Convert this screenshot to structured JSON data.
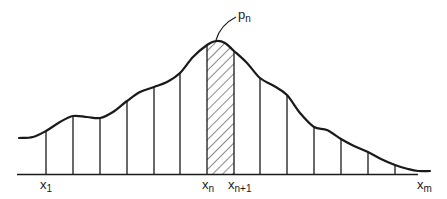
{
  "figure": {
    "type": "riemann-partition-diagram",
    "colors": {
      "ink": "#1a1a1a",
      "background": "#ffffff"
    },
    "labels": {
      "x1": {
        "main": "x",
        "sub": "1"
      },
      "xn": {
        "main": "x",
        "sub": "n"
      },
      "xn1": {
        "main": "x",
        "sub": "n+1"
      },
      "xm": {
        "main": "x",
        "sub": "m"
      },
      "pn": {
        "main": "p",
        "sub": "n"
      }
    },
    "partition_count": 15,
    "highlighted_strip": {
      "from": "x_n",
      "to": "x_n+1",
      "style": "diagonal-hatch"
    }
  }
}
